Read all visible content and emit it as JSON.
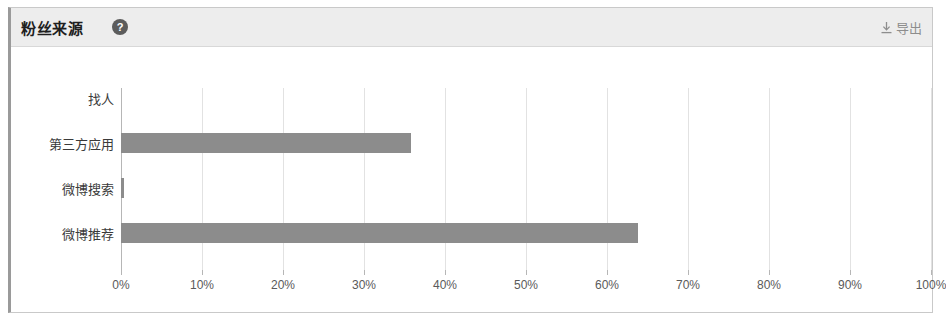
{
  "card": {
    "title": "粉丝来源",
    "help_icon": "question-mark-circle",
    "export_label": "导出",
    "export_icon": "download-icon"
  },
  "chart_data": {
    "type": "bar",
    "orientation": "horizontal",
    "title": "粉丝来源",
    "xlabel": "",
    "ylabel": "",
    "categories": [
      "找人",
      "第三方应用",
      "微博搜索",
      "微博推荐"
    ],
    "values": [
      0,
      35.8,
      0.4,
      63.8
    ],
    "value_unit": "%",
    "xlim": [
      0,
      100
    ],
    "xticks": [
      0,
      10,
      20,
      30,
      40,
      50,
      60,
      70,
      80,
      90,
      100
    ],
    "xtick_labels": [
      "0%",
      "10%",
      "20%",
      "30%",
      "40%",
      "50%",
      "60%",
      "70%",
      "80%",
      "90%",
      "100%"
    ],
    "grid": true,
    "grid_axis": "x",
    "legend": false,
    "bar_color": "#8c8c8c",
    "grid_color": "#e2e2e2",
    "axis_color": "#b6b6b6"
  }
}
